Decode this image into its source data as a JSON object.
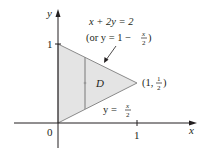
{
  "diagram": {
    "axes": {
      "x_label": "x",
      "y_label": "y",
      "origin_label": "0",
      "x_tick_label": "1",
      "y_tick_label": "1"
    },
    "region": {
      "label": "D",
      "fill": "#e4e4e4",
      "edge_color": "#8a8a8a"
    },
    "curves": {
      "upper_line": {
        "equation": "x + 2y = 2",
        "alt_prefix": "(or y = 1 − ",
        "alt_num": "x",
        "alt_den": "2",
        "alt_suffix": ")"
      },
      "lower_line": {
        "prefix": "y = ",
        "num": "x",
        "den": "2"
      }
    },
    "vertex": {
      "prefix": "(1, ",
      "num": "1",
      "den": "2",
      "suffix": ")"
    }
  }
}
